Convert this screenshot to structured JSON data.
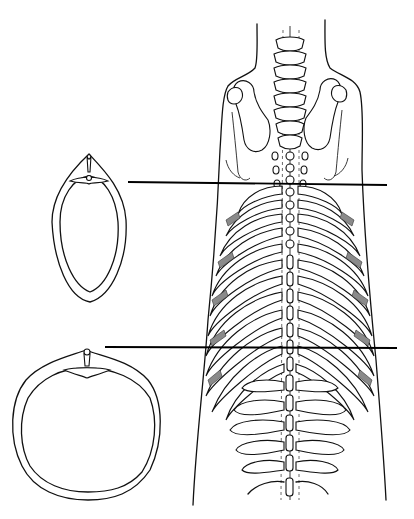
{
  "figure": {
    "type": "anatomical-illustration",
    "labels": [],
    "colors": {
      "ink": "#111111",
      "background": "#ffffff",
      "hatching": "#8a8a8a"
    }
  },
  "sections": [
    {
      "name": "upper-thoracic-section",
      "shape": "narrow-oval",
      "line_y": 183
    },
    {
      "name": "lower-thoracic-section",
      "shape": "round",
      "line_y": 347
    }
  ]
}
